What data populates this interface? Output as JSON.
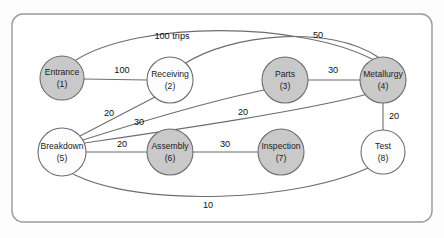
{
  "diagram": {
    "type": "node-link-network",
    "title": "",
    "frame": {
      "x": 12,
      "y": 14,
      "width": 420,
      "height": 208,
      "corner_radius": 11,
      "stroke": "#9a9a9a",
      "fill": "#ffffff"
    },
    "colors": {
      "node_gray": "#c9c9c9",
      "node_white": "#fdfdfd",
      "stroke": "#6d6d6d",
      "label_text": "#101010",
      "background": "#fdfdfd"
    },
    "nodes": [
      {
        "id": "1",
        "label": "Entrance",
        "id_label": "(1)",
        "cx": 62,
        "cy": 78,
        "r": 22,
        "fill": "gray"
      },
      {
        "id": "2",
        "label": "Receiving",
        "id_label": "(2)",
        "cx": 170,
        "cy": 80,
        "r": 23,
        "fill": "white"
      },
      {
        "id": "3",
        "label": "Parts",
        "id_label": "(3)",
        "cx": 285,
        "cy": 80,
        "r": 23,
        "fill": "gray"
      },
      {
        "id": "4",
        "label": "Metallurgy",
        "id_label": "(4)",
        "cx": 383,
        "cy": 80,
        "r": 23,
        "fill": "gray"
      },
      {
        "id": "5",
        "label": "Breakdown",
        "id_label": "(5)",
        "cx": 62,
        "cy": 152,
        "r": 24,
        "fill": "white"
      },
      {
        "id": "6",
        "label": "Assembly",
        "id_label": "(6)",
        "cx": 170,
        "cy": 152,
        "r": 23,
        "fill": "gray"
      },
      {
        "id": "7",
        "label": "Inspection",
        "id_label": "(7)",
        "cx": 281,
        "cy": 152,
        "r": 23,
        "fill": "gray"
      },
      {
        "id": "8",
        "label": "Test",
        "id_label": "(8)",
        "cx": 383,
        "cy": 152,
        "r": 22,
        "fill": "white"
      }
    ],
    "edges": [
      {
        "name": "edge-entrance-metallurgy",
        "from": "1",
        "to": "4",
        "label": "100 trips",
        "label_x": 172,
        "label_y": 37,
        "path": "M 76 60 C 140 20, 300 22, 372 59"
      },
      {
        "name": "edge-entrance-receiving",
        "from": "1",
        "to": "2",
        "label": "100",
        "label_x": 122,
        "label_y": 71,
        "path": "M 84 79 L 147 80"
      },
      {
        "name": "edge-receiving-metallurgy",
        "from": "2",
        "to": "4",
        "label": "50",
        "label_x": 318,
        "label_y": 36,
        "path": "M 184 64 C 230 34, 330 24, 378 57"
      },
      {
        "name": "edge-parts-metallurgy",
        "from": "3",
        "to": "4",
        "label": "30",
        "label_x": 333,
        "label_y": 71,
        "path": "M 308 80 L 360 80"
      },
      {
        "name": "edge-breakdown-receiving",
        "from": "5",
        "to": "2",
        "label": "20",
        "label_x": 109,
        "label_y": 114,
        "path": "M 80 136 L 155 97"
      },
      {
        "name": "edge-breakdown-parts",
        "from": "5",
        "to": "3",
        "label": "30",
        "label_x": 139,
        "label_y": 123,
        "path": "M 83 140 C 140 122, 215 100, 264 90"
      },
      {
        "name": "edge-breakdown-metallurgy",
        "from": "5",
        "to": "4",
        "label": "20",
        "label_x": 243,
        "label_y": 113,
        "path": "M 85 143 C 160 132, 300 112, 368 94"
      },
      {
        "name": "edge-breakdown-assembly",
        "from": "5",
        "to": "6",
        "label": "20",
        "label_x": 122,
        "label_y": 145,
        "path": "M 86 152 L 147 152"
      },
      {
        "name": "edge-assembly-inspection",
        "from": "6",
        "to": "7",
        "label": "30",
        "label_x": 225,
        "label_y": 145,
        "path": "M 193 152 L 258 152"
      },
      {
        "name": "edge-metallurgy-test",
        "from": "4",
        "to": "8",
        "label": "20",
        "label_x": 394,
        "label_y": 117,
        "path": "M 383 103 L 383 130"
      },
      {
        "name": "edge-breakdown-test",
        "from": "5",
        "to": "8",
        "label": "10",
        "label_x": 208,
        "label_y": 206,
        "path": "M 73 174 C 140 208, 300 202, 372 166"
      }
    ]
  }
}
